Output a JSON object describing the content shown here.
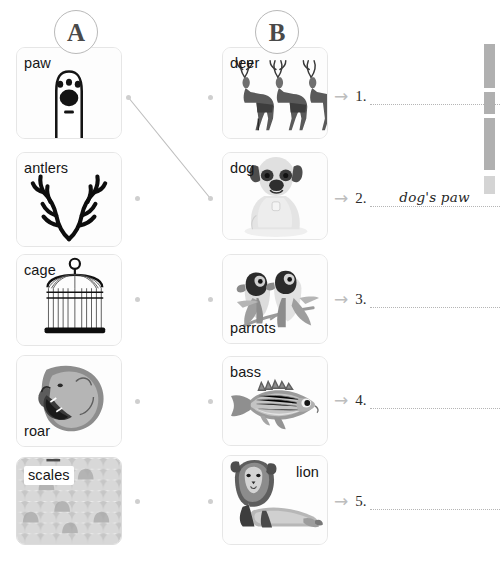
{
  "columns": {
    "left_badge": "A",
    "right_badge": "B"
  },
  "left_items": [
    {
      "label": "paw",
      "icon": "paw-print-icon",
      "label_pos": "tl"
    },
    {
      "label": "antlers",
      "icon": "antlers-icon",
      "label_pos": "tl"
    },
    {
      "label": "cage",
      "icon": "birdcage-icon",
      "label_pos": "tl"
    },
    {
      "label": "roar",
      "icon": "roaring-lion-icon",
      "label_pos": "bl"
    },
    {
      "label": "scales",
      "icon": "fish-scales-icon",
      "label_pos": "tl"
    }
  ],
  "right_items": [
    {
      "label": "deer",
      "icon": "deer-herd-icon",
      "label_pos": "tl"
    },
    {
      "label": "dog",
      "icon": "pug-dog-icon",
      "label_pos": "tl"
    },
    {
      "label": "parrots",
      "icon": "parrot-pair-icon",
      "label_pos": "bl"
    },
    {
      "label": "bass",
      "icon": "bass-fish-icon",
      "label_pos": "tl"
    },
    {
      "label": "lion",
      "icon": "lying-lion-icon",
      "label_pos": "tr"
    }
  ],
  "answers": [
    {
      "number": "1.",
      "value": ""
    },
    {
      "number": "2.",
      "value": "dog's paw"
    },
    {
      "number": "3.",
      "value": ""
    },
    {
      "number": "4.",
      "value": ""
    },
    {
      "number": "5.",
      "value": ""
    }
  ],
  "connections": [
    {
      "from": "paw",
      "to": "dog"
    }
  ],
  "arrow_glyph": "→",
  "colors": {
    "card_border": "#e6e6e6",
    "dot": "#cfcfcf",
    "line": "#bdbdbd",
    "text": "#161616",
    "blank_rule": "#b5b5b5"
  }
}
